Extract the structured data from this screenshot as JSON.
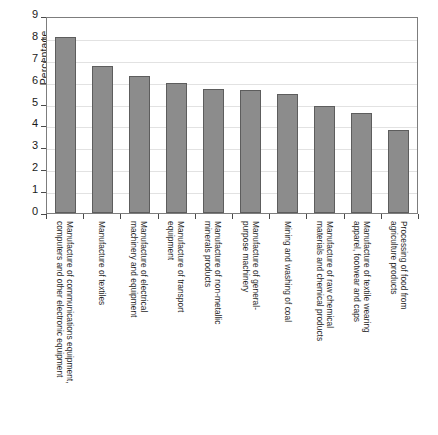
{
  "chart_data": {
    "type": "bar",
    "title": "",
    "xlabel": "",
    "ylabel": "Percentage",
    "ylim": [
      0,
      9
    ],
    "yticks": [
      0,
      1,
      2,
      3,
      4,
      5,
      6,
      7,
      8,
      9
    ],
    "grid": true,
    "legend": false,
    "orientation": "vertical",
    "bar_color": "#8c8c8c",
    "bar_edge_color": "#5d5d5d",
    "categories": [
      "Manufacture of communications equipment,\ncomputers and other electronic equipment",
      "Manufacture of textiles",
      "Manufacture of electrical\nmachinery and equipment",
      "Manufacture of transport\nequipment",
      "Manufacture of non-metallic\nminerals products",
      "Manufacture of general-\npurpose machinery",
      "Mining and washing of coal",
      "Manufacture of raw chemical\nmaterials and chemical products",
      "Manufacture of textile wearing\napparel, footwear and caps",
      "Processing of food from\nagriculture products"
    ],
    "values": [
      8.05,
      6.7,
      6.25,
      5.95,
      5.65,
      5.6,
      5.45,
      4.9,
      4.55,
      3.8
    ]
  },
  "axis": {
    "y_title": "Percentage",
    "y_tick_labels": [
      "0",
      "1",
      "2",
      "3",
      "4",
      "5",
      "6",
      "7",
      "8",
      "9"
    ]
  }
}
